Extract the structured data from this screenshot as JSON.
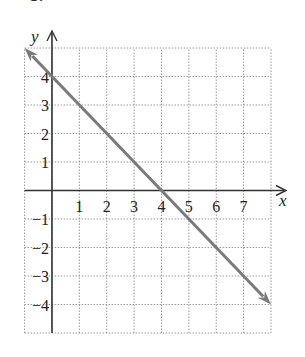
{
  "part_label": "b.",
  "chart_data": {
    "type": "line",
    "title": "",
    "xlabel": "x",
    "ylabel": "y",
    "xlim": [
      -1,
      8
    ],
    "ylim": [
      -5,
      5
    ],
    "grid": true,
    "grid_style": "dotted",
    "x_ticks": [
      1,
      2,
      3,
      4,
      5,
      6,
      7
    ],
    "y_ticks": [
      -4,
      -3,
      -2,
      -1,
      1,
      2,
      3,
      4
    ],
    "series": [
      {
        "name": "line",
        "equation": "y = -x + 4",
        "x": [
          -1,
          8
        ],
        "y": [
          5,
          -4
        ],
        "arrows": "both",
        "color": "#7a7a7a"
      }
    ],
    "intercepts": {
      "x_intercept": 4,
      "y_intercept": 4
    }
  },
  "colors": {
    "line": "#7a7a7a",
    "axis": "#333333",
    "grid": "#9a9a9a"
  }
}
